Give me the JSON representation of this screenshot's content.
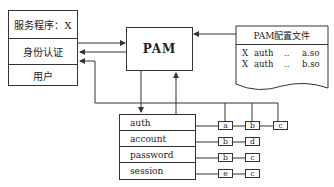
{
  "service_box": {
    "title": "服务程序：X",
    "rows": [
      "身份认证",
      "用户"
    ]
  },
  "pam_box": {
    "label": "PAM"
  },
  "config_file": {
    "title": "PAM配置文件",
    "entries": [
      {
        "service": "X",
        "type": "auth",
        "dots": "..",
        "module": "a.so"
      },
      {
        "service": "X",
        "type": "auth",
        "dots": "..",
        "module": "b.so"
      }
    ]
  },
  "module_types": [
    "auth",
    "account",
    "password",
    "session"
  ],
  "module_chains": [
    [
      "a",
      "b",
      "c"
    ],
    [
      "b",
      "d"
    ],
    [
      "b",
      "c"
    ],
    [
      "e",
      "c"
    ]
  ],
  "colors": {
    "line": "#333333",
    "background": "#ffffff"
  }
}
